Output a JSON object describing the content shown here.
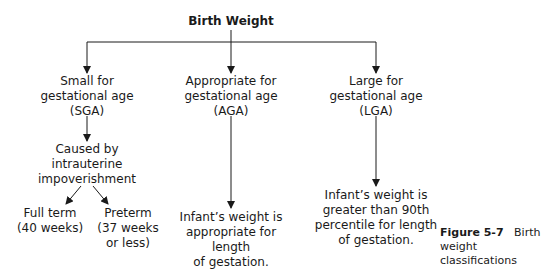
{
  "root": {
    "label": "Birth Weight"
  },
  "branches": [
    {
      "label": "Small for\ngestational age\n(SGA)"
    },
    {
      "label": "Appropriate for\ngestational age\n(AGA)"
    },
    {
      "label": "Large for\ngestational age\n(LGA)"
    }
  ],
  "sga_cause": {
    "label": "Caused by\nintrauterine\nimpoverishment"
  },
  "sga_children": [
    {
      "label": "Full term\n(40 weeks)"
    },
    {
      "label": "Preterm\n(37 weeks\nor less)"
    }
  ],
  "aga_desc": {
    "label": "Infant’s weight is\nappropriate for length\nof gestation."
  },
  "lga_desc": {
    "label": "Infant’s weight is\ngreater than 90th\npercentile for length\nof gestation."
  },
  "caption": {
    "number": "Figure 5-7",
    "text": "Birth weight\nclassifications"
  }
}
